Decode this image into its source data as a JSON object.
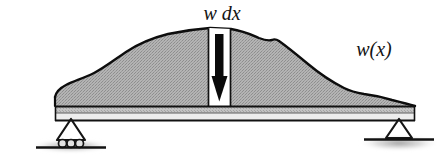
{
  "figure": {
    "background_color": "#ffffff"
  },
  "labels": {
    "load_element": "w  dx",
    "load_function": "w(x)"
  },
  "colors": {
    "load_fill": "#aaaaaa",
    "load_outline": "#0d0d0d",
    "beam_fill_top": "#b9b9b9",
    "beam_fill_bottom": "#ededed",
    "beam_outline": "#111111",
    "arrow_fill": "#0a0a0a",
    "strip_fill": "#ffffff",
    "ground_line": "#121212",
    "shadow": "#9a9a9a",
    "text": "#141414"
  },
  "geometry": {
    "beam": {
      "x_left": 55,
      "x_right": 415,
      "y_top": 106,
      "y_bottom": 121
    },
    "strip": {
      "x_left": 208,
      "x_right": 231,
      "y_top": 29,
      "y_bottom": 106
    },
    "arrow": {
      "x": 219,
      "y_start": 34,
      "y_tip": 101
    },
    "support_left": {
      "x": 71,
      "y": 121,
      "type": "roller"
    },
    "support_right": {
      "x": 398,
      "y": 121,
      "type": "pin"
    }
  },
  "elements": {
    "load_region_name": "distributed-load-region",
    "beam_name": "beam",
    "arrow_name": "load-arrow",
    "strip_name": "differential-element-strip",
    "left_support_name": "roller-support",
    "right_support_name": "pin-support"
  }
}
